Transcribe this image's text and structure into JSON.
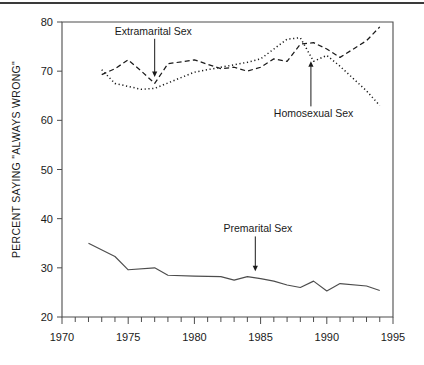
{
  "figure": {
    "top_rule": true,
    "background": "#ffffff",
    "ink": "#1a1a1a"
  },
  "chart_data": {
    "type": "line",
    "title": "",
    "xlabel": "",
    "ylabel": "PERCENT SAYING \"ALWAYS WRONG\"",
    "xlim": [
      1970,
      1995
    ],
    "ylim": [
      20,
      80
    ],
    "xticks": [
      1970,
      1975,
      1980,
      1985,
      1990,
      1995
    ],
    "xtick_labels": [
      "1970",
      "1975",
      "1980",
      "1985",
      "1990",
      "1995"
    ],
    "minor_xtick_interval": 1,
    "yticks": [
      20,
      30,
      40,
      50,
      60,
      70,
      80
    ],
    "ytick_labels": [
      "20",
      "30",
      "40",
      "50",
      "60",
      "70",
      "80"
    ],
    "grid": false,
    "legend": "none (inline annotated labels with arrows)",
    "series": [
      {
        "name": "Extramarital Sex",
        "style": "dashed",
        "color": "#1a1a1a",
        "x": [
          1973,
          1974,
          1975,
          1976,
          1977,
          1978,
          1980,
          1982,
          1983,
          1984,
          1985,
          1986,
          1987,
          1988,
          1989,
          1990,
          1991,
          1993,
          1994
        ],
        "values": [
          69.3,
          70.5,
          72.3,
          70.0,
          67.5,
          71.5,
          72.3,
          70.5,
          70.8,
          70.0,
          70.8,
          72.5,
          72.0,
          75.5,
          75.8,
          74.5,
          72.8,
          76.2,
          79.0
        ]
      },
      {
        "name": "Homosexual Sex",
        "style": "dotted",
        "color": "#1a1a1a",
        "x": [
          1973,
          1974,
          1976,
          1977,
          1980,
          1982,
          1984,
          1985,
          1987,
          1988,
          1989,
          1990,
          1991,
          1993,
          1994
        ],
        "values": [
          70.3,
          67.5,
          66.3,
          66.5,
          69.8,
          70.8,
          71.8,
          72.5,
          76.5,
          76.8,
          72.0,
          73.2,
          71.0,
          66.0,
          63.0
        ]
      },
      {
        "name": "Premarital Sex",
        "style": "solid",
        "color": "#4d4d4d",
        "x": [
          1972,
          1974,
          1975,
          1977,
          1978,
          1980,
          1982,
          1983,
          1984,
          1985,
          1986,
          1987,
          1988,
          1989,
          1990,
          1991,
          1993,
          1994
        ],
        "values": [
          35.0,
          32.3,
          29.6,
          30.0,
          28.5,
          28.3,
          28.2,
          27.5,
          28.2,
          27.8,
          27.3,
          26.5,
          26.0,
          27.3,
          25.3,
          26.8,
          26.3,
          25.4
        ]
      }
    ],
    "annotations": [
      {
        "label": "Extramarital Sex",
        "target_year": 1977.0,
        "target_value": 68.6,
        "label_x": 1976.9,
        "label_y": 77.4
      },
      {
        "label": "Homosexual Sex",
        "target_year": 1988.8,
        "target_value": 72.2,
        "label_x": 1989.0,
        "label_y": 60.6
      },
      {
        "label": "Premarital Sex",
        "target_year": 1984.6,
        "target_value": 29.1,
        "label_x": 1984.8,
        "label_y": 37.2
      }
    ]
  }
}
